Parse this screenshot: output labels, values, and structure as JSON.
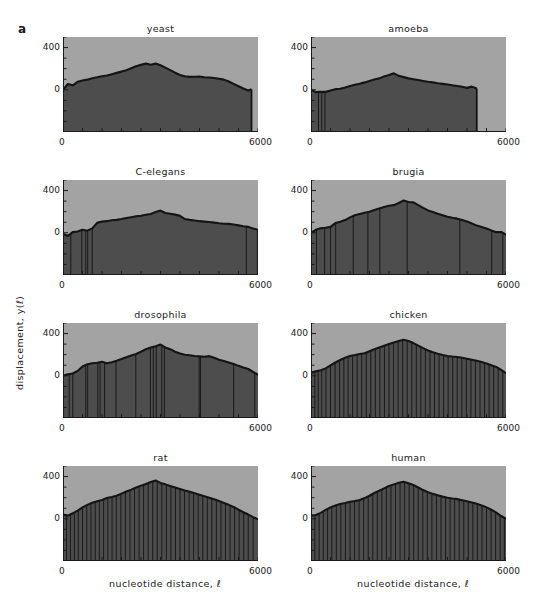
{
  "figure": {
    "panel_letter": "a",
    "ylabel": "displacement, y(ℓ)",
    "xlabel_left": "nucleotide distance, ℓ",
    "xlabel_right": "nucleotide distance, ℓ",
    "ghost_top_text": "· ·  ·  · ·    · ·"
  },
  "colors": {
    "background_above": "#a3a3a3",
    "fill_below": "#4d4d4d",
    "curve": "#141414",
    "axis": "#1a1a1a",
    "text": "#1a1a1a",
    "page": "#ffffff"
  },
  "axes": {
    "y_ticks_labeled": [
      "400",
      "0"
    ],
    "x_ticks_labeled": [
      "0",
      "6000"
    ],
    "ylim": [
      -400,
      500
    ],
    "xlim": [
      0,
      6000
    ],
    "y_tick_values": [
      500,
      400,
      300,
      200,
      100,
      0,
      -100,
      -200,
      -300,
      -400
    ],
    "x_tick_values": [
      0,
      600,
      1200,
      1800,
      2400,
      3000,
      3600,
      4200,
      4800,
      5400,
      6000
    ],
    "grid": false,
    "legend": "none"
  },
  "chart_data": {
    "type": "area",
    "xlabel": "nucleotide distance, ℓ",
    "ylabel": "displacement, y(ℓ)",
    "xlim": [
      0,
      6000
    ],
    "ylim": [
      -400,
      500
    ],
    "x_ticks": [
      0,
      6000
    ],
    "y_ticks": [
      0,
      400
    ],
    "panels": [
      {
        "name": "yeast",
        "row": 0,
        "col": 0,
        "x_end": 5800,
        "x": [
          0,
          150,
          300,
          450,
          600,
          750,
          900,
          1050,
          1200,
          1350,
          1500,
          1650,
          1800,
          1950,
          2100,
          2250,
          2400,
          2550,
          2700,
          2850,
          3000,
          3150,
          3300,
          3450,
          3600,
          3750,
          3900,
          4050,
          4200,
          4350,
          4500,
          4650,
          4800,
          4950,
          5100,
          5250,
          5400,
          5550,
          5700,
          5800
        ],
        "y": [
          0,
          55,
          42,
          75,
          88,
          96,
          110,
          118,
          128,
          136,
          148,
          160,
          172,
          186,
          204,
          222,
          236,
          248,
          238,
          248,
          232,
          210,
          186,
          162,
          140,
          128,
          122,
          124,
          126,
          118,
          116,
          112,
          104,
          96,
          78,
          56,
          34,
          12,
          -6,
          4
        ],
        "spikes": []
      },
      {
        "name": "amoeba",
        "row": 0,
        "col": 1,
        "x_end": 5100,
        "x": [
          0,
          150,
          300,
          450,
          600,
          750,
          900,
          1050,
          1200,
          1350,
          1500,
          1650,
          1800,
          1950,
          2100,
          2250,
          2400,
          2550,
          2700,
          2850,
          3000,
          3150,
          3300,
          3450,
          3600,
          3750,
          3900,
          4050,
          4200,
          4350,
          4500,
          4650,
          4800,
          4950,
          5100
        ],
        "y": [
          0,
          -22,
          -18,
          -20,
          -8,
          6,
          10,
          22,
          36,
          48,
          58,
          70,
          84,
          98,
          108,
          126,
          140,
          156,
          132,
          120,
          108,
          100,
          92,
          84,
          76,
          70,
          62,
          56,
          50,
          42,
          36,
          28,
          18,
          30,
          12
        ],
        "spikes": [
          230,
          330,
          430
        ]
      },
      {
        "name": "C-elegans",
        "row": 1,
        "col": 0,
        "x_end": 6000,
        "x": [
          0,
          150,
          300,
          450,
          600,
          750,
          900,
          1050,
          1200,
          1350,
          1500,
          1650,
          1800,
          1950,
          2100,
          2250,
          2400,
          2550,
          2700,
          2850,
          3000,
          3150,
          3300,
          3450,
          3600,
          3750,
          3900,
          4050,
          4200,
          4350,
          4500,
          4650,
          4800,
          4950,
          5100,
          5250,
          5400,
          5550,
          5700,
          5850,
          6000
        ],
        "y": [
          -10,
          -30,
          6,
          12,
          28,
          20,
          42,
          94,
          106,
          110,
          118,
          122,
          130,
          140,
          148,
          156,
          162,
          170,
          178,
          196,
          210,
          188,
          180,
          172,
          160,
          130,
          122,
          116,
          110,
          106,
          102,
          96,
          90,
          86,
          84,
          78,
          70,
          62,
          56,
          40,
          28
        ],
        "spikes": [
          240,
          580,
          700,
          760,
          900,
          5640,
          5980
        ]
      },
      {
        "name": "brugia",
        "row": 1,
        "col": 1,
        "x_end": 6000,
        "x": [
          0,
          150,
          300,
          450,
          600,
          750,
          900,
          1050,
          1200,
          1350,
          1500,
          1650,
          1800,
          1950,
          2100,
          2250,
          2400,
          2550,
          2700,
          2850,
          3000,
          3150,
          3300,
          3450,
          3600,
          3750,
          3900,
          4050,
          4200,
          4350,
          4500,
          4650,
          4800,
          4950,
          5100,
          5250,
          5400,
          5550,
          5700,
          5850,
          6000
        ],
        "y": [
          0,
          28,
          42,
          48,
          56,
          92,
          104,
          120,
          146,
          166,
          178,
          190,
          200,
          216,
          230,
          244,
          256,
          262,
          282,
          306,
          292,
          288,
          262,
          236,
          212,
          196,
          180,
          166,
          152,
          142,
          134,
          120,
          106,
          88,
          68,
          54,
          40,
          22,
          6,
          8,
          -18
        ],
        "spikes": [
          170,
          420,
          600,
          760,
          1300,
          1750,
          2120,
          2960,
          4580,
          5560,
          5900
        ]
      },
      {
        "name": "drosophila",
        "row": 2,
        "col": 0,
        "x_end": 6000,
        "x": [
          0,
          150,
          300,
          450,
          600,
          750,
          900,
          1050,
          1200,
          1350,
          1500,
          1650,
          1800,
          1950,
          2100,
          2250,
          2400,
          2550,
          2700,
          2850,
          3000,
          3150,
          3300,
          3450,
          3600,
          3750,
          3900,
          4050,
          4200,
          4350,
          4500,
          4650,
          4800,
          4950,
          5100,
          5250,
          5400,
          5550,
          5700,
          5850,
          6000
        ],
        "y": [
          0,
          14,
          22,
          46,
          88,
          110,
          118,
          124,
          132,
          118,
          128,
          142,
          158,
          176,
          192,
          206,
          228,
          252,
          268,
          280,
          296,
          268,
          252,
          228,
          212,
          200,
          194,
          188,
          184,
          180,
          186,
          170,
          152,
          140,
          126,
          112,
          94,
          78,
          64,
          36,
          10
        ],
        "spikes": [
          190,
          300,
          700,
          760,
          1070,
          1140,
          1280,
          1630,
          2240,
          2690,
          2780,
          2870,
          3040,
          3120,
          4190,
          4230,
          5250,
          5900
        ]
      },
      {
        "name": "chicken",
        "row": 2,
        "col": 1,
        "x_end": 6000,
        "x": [
          0,
          150,
          300,
          450,
          600,
          750,
          900,
          1050,
          1200,
          1350,
          1500,
          1650,
          1800,
          1950,
          2100,
          2250,
          2400,
          2550,
          2700,
          2850,
          3000,
          3150,
          3300,
          3450,
          3600,
          3750,
          3900,
          4050,
          4200,
          4350,
          4500,
          4650,
          4800,
          4950,
          5100,
          5250,
          5400,
          5550,
          5700,
          5850,
          6000
        ],
        "y": [
          30,
          42,
          52,
          70,
          98,
          126,
          150,
          172,
          188,
          196,
          206,
          214,
          232,
          252,
          268,
          284,
          300,
          316,
          330,
          342,
          330,
          310,
          286,
          262,
          240,
          222,
          208,
          196,
          188,
          182,
          178,
          170,
          162,
          152,
          142,
          130,
          116,
          100,
          84,
          56,
          24
        ],
        "spikes": [
          120,
          220,
          330,
          460,
          600,
          740,
          880,
          1010,
          1140,
          1280,
          1420,
          1560,
          1700,
          1840,
          1980,
          2120,
          2260,
          2400,
          2540,
          2680,
          2820,
          2960,
          3100,
          3240,
          3380,
          3520,
          3660,
          3800,
          3940,
          4080,
          4220,
          4360,
          4500,
          4640,
          4780,
          4920,
          5060,
          5200,
          5340,
          5480,
          5620,
          5760,
          5900
        ]
      },
      {
        "name": "rat",
        "row": 3,
        "col": 0,
        "x_end": 6000,
        "x": [
          0,
          150,
          300,
          450,
          600,
          750,
          900,
          1050,
          1200,
          1350,
          1500,
          1650,
          1800,
          1950,
          2100,
          2250,
          2400,
          2550,
          2700,
          2850,
          3000,
          3150,
          3300,
          3450,
          3600,
          3750,
          3900,
          4050,
          4200,
          4350,
          4500,
          4650,
          4800,
          4950,
          5100,
          5250,
          5400,
          5550,
          5700,
          5850,
          6000
        ],
        "y": [
          40,
          30,
          52,
          78,
          108,
          132,
          152,
          166,
          178,
          196,
          206,
          218,
          238,
          258,
          276,
          296,
          314,
          330,
          348,
          362,
          340,
          326,
          310,
          296,
          282,
          268,
          256,
          242,
          228,
          214,
          200,
          184,
          168,
          150,
          132,
          112,
          86,
          62,
          40,
          16,
          -6
        ],
        "spikes": [
          110,
          230,
          350,
          470,
          600,
          730,
          860,
          990,
          1120,
          1250,
          1380,
          1510,
          1640,
          1780,
          1920,
          2060,
          2200,
          2340,
          2480,
          2620,
          2760,
          2900,
          3040,
          3180,
          3320,
          3460,
          3600,
          3740,
          3880,
          4020,
          4160,
          4300,
          4440,
          4580,
          4720,
          4860,
          5000,
          5140,
          5280,
          5420,
          5560,
          5700,
          5850
        ]
      },
      {
        "name": "human",
        "row": 3,
        "col": 1,
        "x_end": 6000,
        "x": [
          0,
          150,
          300,
          450,
          600,
          750,
          900,
          1050,
          1200,
          1350,
          1500,
          1650,
          1800,
          1950,
          2100,
          2250,
          2400,
          2550,
          2700,
          2850,
          3000,
          3150,
          3300,
          3450,
          3600,
          3750,
          3900,
          4050,
          4200,
          4350,
          4500,
          4650,
          4800,
          4950,
          5100,
          5250,
          5400,
          5550,
          5700,
          5850,
          6000
        ],
        "y": [
          30,
          36,
          56,
          84,
          108,
          126,
          140,
          150,
          162,
          168,
          178,
          196,
          218,
          244,
          266,
          288,
          310,
          326,
          342,
          350,
          336,
          320,
          296,
          272,
          252,
          236,
          222,
          210,
          200,
          192,
          186,
          176,
          166,
          154,
          142,
          126,
          108,
          86,
          58,
          26,
          0
        ],
        "spikes": [
          120,
          250,
          380,
          510,
          640,
          780,
          920,
          1060,
          1200,
          1340,
          1480,
          1620,
          1760,
          1900,
          2040,
          2180,
          2320,
          2460,
          2600,
          2740,
          2880,
          3020,
          3160,
          3300,
          3440,
          3580,
          3720,
          3860,
          4000,
          4140,
          4280,
          4420,
          4560,
          4700,
          4840,
          4980,
          5120,
          5260,
          5400,
          5540,
          5680,
          5820,
          5950
        ]
      }
    ]
  }
}
